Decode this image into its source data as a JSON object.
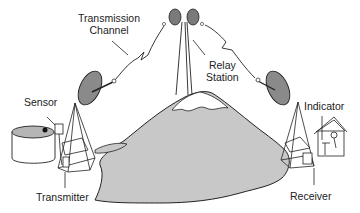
{
  "diagram": {
    "labels": {
      "transmission_channel_line1": "Transmission",
      "transmission_channel_line2": "Channel",
      "relay_station_line1": "Relay",
      "relay_station_line2": "Station",
      "sensor": "Sensor",
      "transmitter": "Transmitter",
      "indicator": "Indicator",
      "receiver": "Receiver"
    },
    "colors": {
      "mountain": "#c8c8c8",
      "dish": "#8a8a8a",
      "line": "#222222",
      "tank_liquid": "#b5b5b5"
    }
  }
}
